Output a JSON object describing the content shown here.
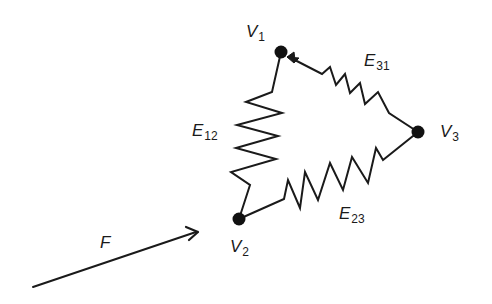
{
  "diagram": {
    "type": "spring-mass network",
    "colors": {
      "ink": "#1a1a1a",
      "background": "#ffffff"
    },
    "nodes": [
      {
        "id": "V1",
        "letter": "V",
        "sub": "1",
        "x": 281,
        "y": 52
      },
      {
        "id": "V2",
        "letter": "V",
        "sub": "2",
        "x": 239,
        "y": 219
      },
      {
        "id": "V3",
        "letter": "V",
        "sub": "3",
        "x": 418,
        "y": 132
      }
    ],
    "edges": [
      {
        "id": "E12",
        "letter": "E",
        "sub": "12",
        "from": "V1",
        "to": "V2",
        "kind": "spring"
      },
      {
        "id": "E23",
        "letter": "E",
        "sub": "23",
        "from": "V2",
        "to": "V3",
        "kind": "spring"
      },
      {
        "id": "E31",
        "letter": "E",
        "sub": "31",
        "from": "V3",
        "to": "V1",
        "kind": "spring",
        "arrow_at": "V1"
      }
    ],
    "force": {
      "letter": "F",
      "from": [
        33,
        287
      ],
      "to": [
        197,
        232
      ]
    }
  }
}
